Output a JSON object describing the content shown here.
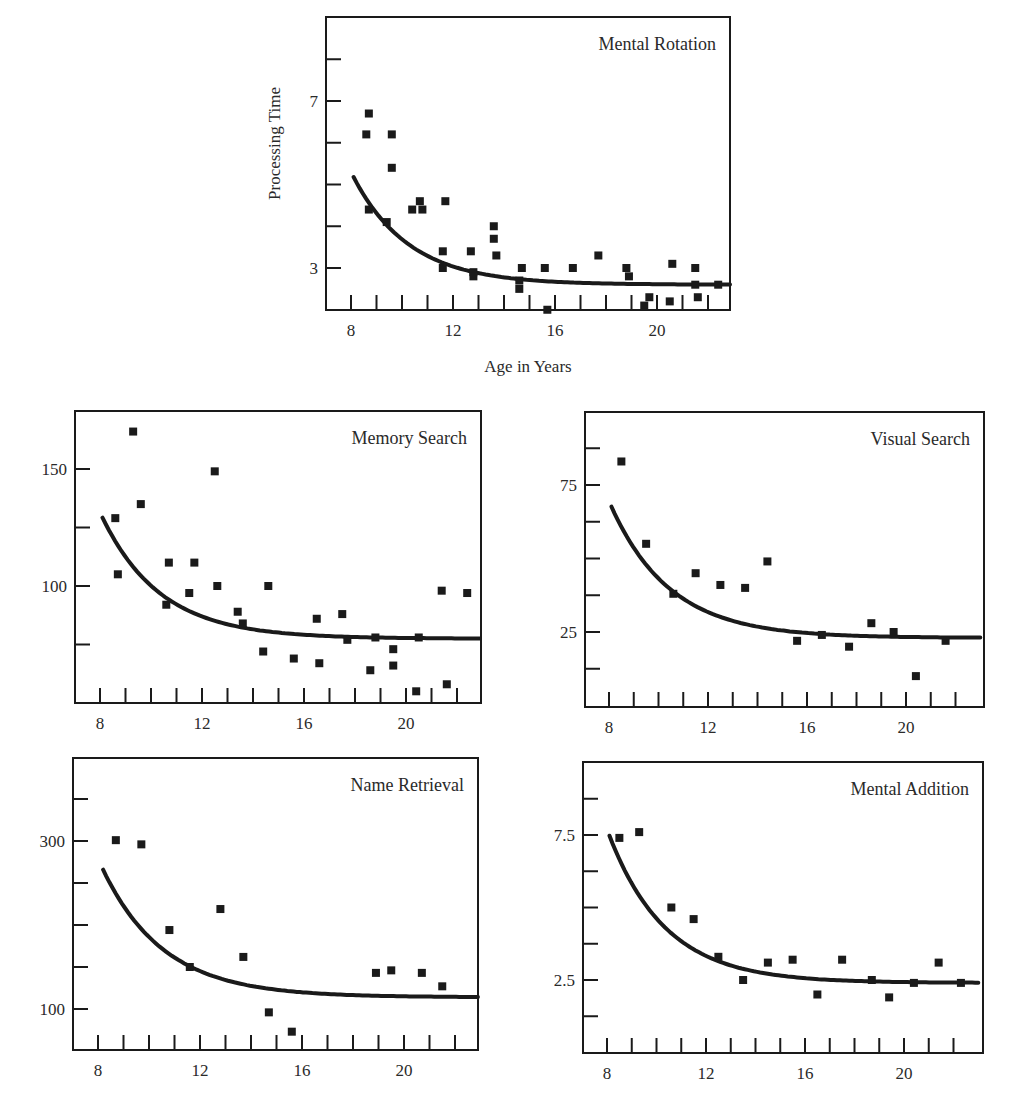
{
  "figure": {
    "width": 1011,
    "height": 1115,
    "ink_color": "#1a1a1a",
    "background": "#ffffff"
  },
  "chart_data": [
    {
      "id": "mental-rotation",
      "type": "scatter",
      "title": "Mental Rotation",
      "xlabel": "Age in Years",
      "ylabel": "Processing Time",
      "frame": {
        "left": 326,
        "top": 17,
        "right": 730,
        "bottom": 310
      },
      "x_scale": {
        "v0": 8,
        "p0": 351,
        "v1": 12,
        "p1": 453
      },
      "y_scale": {
        "v0": 3,
        "p0": 268,
        "v1": 7,
        "p1": 101
      },
      "x_ticks": [
        8,
        9,
        10,
        11,
        12,
        13,
        14,
        15,
        16,
        17,
        18,
        19,
        20,
        21,
        22
      ],
      "x_tick_labels": [
        {
          "v": 8,
          "label": "8"
        },
        {
          "v": 12,
          "label": "12"
        },
        {
          "v": 16,
          "label": "16"
        },
        {
          "v": 20,
          "label": "20"
        }
      ],
      "y_ticks": [
        3,
        4,
        5,
        6,
        7,
        8
      ],
      "y_tick_labels": [
        {
          "v": 3,
          "label": "3"
        },
        {
          "v": 7,
          "label": "7"
        }
      ],
      "xlim": [
        7.0,
        22.9
      ],
      "ylim": [
        2.0,
        9.0
      ],
      "grid": false,
      "legend": null,
      "fit_curve": {
        "form": "y = a + b*exp(-(x-8)/tau)",
        "a": 2.6,
        "b": 2.7,
        "tau": 2.2,
        "x_start": 8.1,
        "x_end": 22.9
      },
      "points": [
        [
          8.6,
          6.2
        ],
        [
          8.7,
          6.7
        ],
        [
          8.7,
          4.4
        ],
        [
          9.4,
          4.1
        ],
        [
          9.6,
          6.2
        ],
        [
          9.6,
          5.4
        ],
        [
          10.4,
          4.4
        ],
        [
          10.7,
          4.6
        ],
        [
          10.8,
          4.4
        ],
        [
          11.6,
          3.4
        ],
        [
          11.6,
          3.0
        ],
        [
          11.7,
          4.6
        ],
        [
          12.7,
          3.4
        ],
        [
          12.8,
          2.9
        ],
        [
          12.8,
          2.8
        ],
        [
          13.6,
          4.0
        ],
        [
          13.6,
          3.7
        ],
        [
          13.7,
          3.3
        ],
        [
          14.6,
          2.7
        ],
        [
          14.6,
          2.5
        ],
        [
          14.7,
          3.0
        ],
        [
          15.6,
          3.0
        ],
        [
          15.7,
          2.0
        ],
        [
          16.7,
          3.0
        ],
        [
          17.7,
          3.3
        ],
        [
          18.8,
          3.0
        ],
        [
          18.9,
          2.8
        ],
        [
          19.5,
          2.1
        ],
        [
          19.7,
          2.3
        ],
        [
          20.5,
          2.2
        ],
        [
          20.6,
          3.1
        ],
        [
          21.5,
          3.0
        ],
        [
          21.5,
          2.6
        ],
        [
          21.6,
          2.3
        ],
        [
          22.4,
          2.6
        ]
      ]
    },
    {
      "id": "memory-search",
      "type": "scatter",
      "title": "Memory Search",
      "xlabel": "",
      "ylabel": "",
      "frame": {
        "left": 75,
        "top": 411,
        "right": 481,
        "bottom": 703
      },
      "x_scale": {
        "v0": 8,
        "p0": 100,
        "v1": 12,
        "p1": 202
      },
      "y_scale": {
        "v0": 100,
        "p0": 586,
        "v1": 150,
        "p1": 469
      },
      "x_ticks": [
        8,
        9,
        10,
        11,
        12,
        13,
        14,
        15,
        16,
        17,
        18,
        19,
        20,
        21,
        22
      ],
      "x_tick_labels": [
        {
          "v": 8,
          "label": "8"
        },
        {
          "v": 12,
          "label": "12"
        },
        {
          "v": 16,
          "label": "16"
        },
        {
          "v": 20,
          "label": "20"
        }
      ],
      "y_ticks": [
        75,
        100,
        125,
        150
      ],
      "y_tick_labels": [
        {
          "v": 100,
          "label": "100"
        },
        {
          "v": 150,
          "label": "150"
        }
      ],
      "xlim": [
        7.0,
        22.9
      ],
      "ylim": [
        50,
        175
      ],
      "grid": false,
      "legend": null,
      "fit_curve": {
        "form": "y = a + b*exp(-(x-8)/tau)",
        "a": 77.5,
        "b": 54,
        "tau": 2.3,
        "x_start": 8.1,
        "x_end": 22.9
      },
      "points": [
        [
          8.6,
          129
        ],
        [
          8.7,
          105
        ],
        [
          9.3,
          166
        ],
        [
          9.6,
          135
        ],
        [
          10.6,
          92
        ],
        [
          10.7,
          110
        ],
        [
          11.5,
          97
        ],
        [
          11.7,
          110
        ],
        [
          12.5,
          149
        ],
        [
          12.6,
          100
        ],
        [
          13.4,
          89
        ],
        [
          13.6,
          84
        ],
        [
          14.4,
          72
        ],
        [
          14.6,
          100
        ],
        [
          15.6,
          69
        ],
        [
          16.5,
          86
        ],
        [
          16.6,
          67
        ],
        [
          17.5,
          88
        ],
        [
          17.7,
          77
        ],
        [
          18.6,
          64
        ],
        [
          18.8,
          78
        ],
        [
          19.5,
          73
        ],
        [
          19.5,
          66
        ],
        [
          20.4,
          55
        ],
        [
          20.5,
          78
        ],
        [
          21.4,
          98
        ],
        [
          21.6,
          58
        ],
        [
          22.4,
          97
        ]
      ]
    },
    {
      "id": "visual-search",
      "type": "scatter",
      "title": "Visual Search",
      "xlabel": "",
      "ylabel": "",
      "frame": {
        "left": 585,
        "top": 412,
        "right": 984,
        "bottom": 707
      },
      "x_scale": {
        "v0": 8,
        "p0": 609,
        "v1": 12,
        "p1": 708
      },
      "y_scale": {
        "v0": 25,
        "p0": 632,
        "v1": 75,
        "p1": 485
      },
      "x_ticks": [
        8,
        9,
        10,
        11,
        12,
        13,
        14,
        15,
        16,
        17,
        18,
        19,
        20,
        21,
        22
      ],
      "x_tick_labels": [
        {
          "v": 8,
          "label": "8"
        },
        {
          "v": 12,
          "label": "12"
        },
        {
          "v": 16,
          "label": "16"
        },
        {
          "v": 20,
          "label": "20"
        }
      ],
      "y_ticks": [
        12.5,
        25,
        37.5,
        50,
        62.5,
        75,
        87.5
      ],
      "y_tick_labels": [
        {
          "v": 25,
          "label": "25"
        },
        {
          "v": 75,
          "label": "75"
        }
      ],
      "xlim": [
        7.0,
        23.0
      ],
      "ylim": [
        0,
        100
      ],
      "grid": false,
      "legend": null,
      "fit_curve": {
        "form": "y = a + b*exp(-(x-8)/tau)",
        "a": 23.0,
        "b": 46.5,
        "tau": 2.4,
        "x_start": 8.1,
        "x_end": 23.0
      },
      "points": [
        [
          8.5,
          83
        ],
        [
          9.5,
          55
        ],
        [
          10.6,
          38
        ],
        [
          11.5,
          45
        ],
        [
          12.5,
          41
        ],
        [
          13.5,
          40
        ],
        [
          14.4,
          49
        ],
        [
          15.6,
          22
        ],
        [
          16.6,
          24
        ],
        [
          17.7,
          20
        ],
        [
          18.6,
          28
        ],
        [
          19.5,
          25
        ],
        [
          20.4,
          10
        ],
        [
          21.6,
          22
        ]
      ]
    },
    {
      "id": "name-retrieval",
      "type": "scatter",
      "title": "Name Retrieval",
      "xlabel": "",
      "ylabel": "",
      "frame": {
        "left": 73,
        "top": 758,
        "right": 478,
        "bottom": 1050
      },
      "x_scale": {
        "v0": 8,
        "p0": 98,
        "v1": 12,
        "p1": 200
      },
      "y_scale": {
        "v0": 100,
        "p0": 1009,
        "v1": 300,
        "p1": 841
      },
      "x_ticks": [
        8,
        9,
        10,
        11,
        12,
        13,
        14,
        15,
        16,
        17,
        18,
        19,
        20,
        21,
        22
      ],
      "x_tick_labels": [
        {
          "v": 8,
          "label": "8"
        },
        {
          "v": 12,
          "label": "12"
        },
        {
          "v": 16,
          "label": "16"
        },
        {
          "v": 20,
          "label": "20"
        }
      ],
      "y_ticks": [
        100,
        150,
        200,
        250,
        300,
        350
      ],
      "y_tick_labels": [
        {
          "v": 100,
          "label": "100"
        },
        {
          "v": 300,
          "label": "300"
        }
      ],
      "xlim": [
        7.0,
        22.9
      ],
      "ylim": [
        50,
        400
      ],
      "grid": false,
      "legend": null,
      "fit_curve": {
        "form": "y = a + b*exp(-(x-8)/tau)",
        "a": 114,
        "b": 165,
        "tau": 2.4,
        "x_start": 8.2,
        "x_end": 22.9
      },
      "points": [
        [
          8.7,
          301
        ],
        [
          9.7,
          296
        ],
        [
          10.8,
          194
        ],
        [
          11.6,
          150
        ],
        [
          12.8,
          219
        ],
        [
          13.7,
          162
        ],
        [
          14.7,
          96
        ],
        [
          15.6,
          73
        ],
        [
          18.9,
          143
        ],
        [
          19.5,
          146
        ],
        [
          20.7,
          143
        ],
        [
          21.5,
          127
        ]
      ]
    },
    {
      "id": "mental-addition",
      "type": "scatter",
      "title": "Mental Addition",
      "xlabel": "",
      "ylabel": "",
      "frame": {
        "left": 583,
        "top": 762,
        "right": 983,
        "bottom": 1053
      },
      "x_scale": {
        "v0": 8,
        "p0": 607,
        "v1": 12,
        "p1": 706
      },
      "y_scale": {
        "v0": 2.5,
        "p0": 980,
        "v1": 7.5,
        "p1": 835
      },
      "x_ticks": [
        8,
        9,
        10,
        11,
        12,
        13,
        14,
        15,
        16,
        17,
        18,
        19,
        20,
        21,
        22
      ],
      "x_tick_labels": [
        {
          "v": 8,
          "label": "8"
        },
        {
          "v": 12,
          "label": "12"
        },
        {
          "v": 16,
          "label": "16"
        },
        {
          "v": 20,
          "label": "20"
        }
      ],
      "y_ticks": [
        1.25,
        2.5,
        3.75,
        5.0,
        6.25,
        7.5,
        8.75
      ],
      "y_tick_labels": [
        {
          "v": 2.5,
          "label": "2.5"
        },
        {
          "v": 7.5,
          "label": "7.5"
        }
      ],
      "xlim": [
        7.0,
        23.0
      ],
      "ylim": [
        0,
        10
      ],
      "grid": false,
      "legend": null,
      "fit_curve": {
        "form": "y = a + b*exp(-(x-8)/tau)",
        "a": 2.4,
        "b": 5.3,
        "tau": 2.3,
        "x_start": 8.1,
        "x_end": 23.0
      },
      "points": [
        [
          8.5,
          7.4
        ],
        [
          9.3,
          7.6
        ],
        [
          10.6,
          5.0
        ],
        [
          11.5,
          4.6
        ],
        [
          12.5,
          3.3
        ],
        [
          13.5,
          2.5
        ],
        [
          14.5,
          3.1
        ],
        [
          15.5,
          3.2
        ],
        [
          16.5,
          2.0
        ],
        [
          17.5,
          3.2
        ],
        [
          18.7,
          2.5
        ],
        [
          19.4,
          1.9
        ],
        [
          20.4,
          2.4
        ],
        [
          21.4,
          3.1
        ],
        [
          22.3,
          2.4
        ]
      ]
    }
  ]
}
